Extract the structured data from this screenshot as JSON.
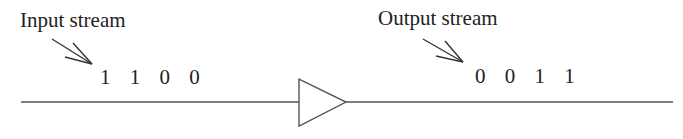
{
  "diagram": {
    "input": {
      "label": "Input stream",
      "bits": "1 1 0 0"
    },
    "output": {
      "label": "Output stream",
      "bits": "0 0 1 1"
    },
    "component": "buffer-triangle",
    "colors": {
      "stroke": "#555555",
      "text": "#222222",
      "background": "#ffffff"
    }
  }
}
